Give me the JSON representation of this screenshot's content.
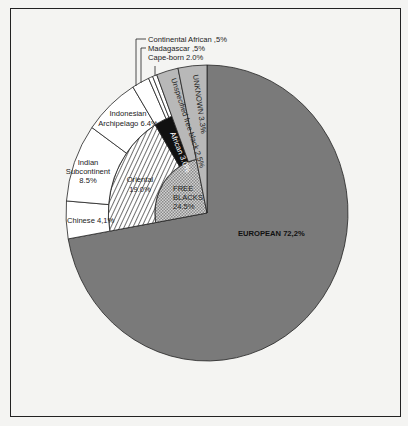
{
  "chart_data": {
    "type": "pie",
    "title": "",
    "start_angle": "12 o'clock, clockwise",
    "slices": [
      {
        "label": "EUROPEAN",
        "value": 72.2,
        "display": "EUROPEAN 72,2%",
        "fill": "#7a7a7a",
        "ring": "full"
      },
      {
        "label": "FREE BLACKS",
        "value": 24.5,
        "display": "FREE BLACKS 24.5%",
        "fill": "crosshatch",
        "ring": "inner",
        "children": [
          {
            "label": "Oriental",
            "value": 19.0,
            "display": "Oriental 19.0%",
            "fill": "diagonal-hatch",
            "children": [
              {
                "label": "Chinese",
                "value": 4.1,
                "display": "Chinese 4,1%"
              },
              {
                "label": "Indian Subcontinent",
                "value": 8.5,
                "display": "Indian Subcontinent 8.5%"
              },
              {
                "label": "Indonesian Archipelago",
                "value": 6.4,
                "display": "Indonesian Archipelago 6.4%"
              }
            ]
          },
          {
            "label": "African",
            "value": 3.0,
            "display": "African 3.0%",
            "fill": "#111111",
            "children": [
              {
                "label": "Cape-born",
                "value": 2.0,
                "display": "Cape-born 2.0%"
              },
              {
                "label": "Madagascar",
                "value": 0.5,
                "display": "Madagascar ,5%"
              },
              {
                "label": "Continental African",
                "value": 0.5,
                "display": "Continental African ,5%"
              }
            ]
          },
          {
            "label": "Unspecified free black",
            "value": 2.5,
            "display": "Unspecified free black 2.5%",
            "fill": "#b8b8b8"
          }
        ]
      },
      {
        "label": "UNKNOWN",
        "value": 3.3,
        "display": "UNKNOWN 3.3%",
        "fill": "#b8b8b8",
        "ring": "full"
      }
    ],
    "legend": null
  },
  "labels": {
    "european": "EUROPEAN 72,2%",
    "unknown": "UNKNOWN 3.3%",
    "unspecified": "Unspecified free black 2.5%",
    "african": "African 3.0%",
    "oriental_1": "Oriental",
    "oriental_2": "19.0%",
    "free_1": "FREE",
    "free_2": "BLACKS",
    "free_3": "24.5%",
    "chinese": "Chinese 4,1%",
    "indian_1": "Indian",
    "indian_2": "Subcontinent",
    "indian_3": "8.5%",
    "indo_1": "Indonesian",
    "indo_2": "Archipelago 6.4%",
    "continental": "Continental African ,5%",
    "madagascar": "Madagascar ,5%",
    "capeborn": "Cape-born 2.0%"
  }
}
